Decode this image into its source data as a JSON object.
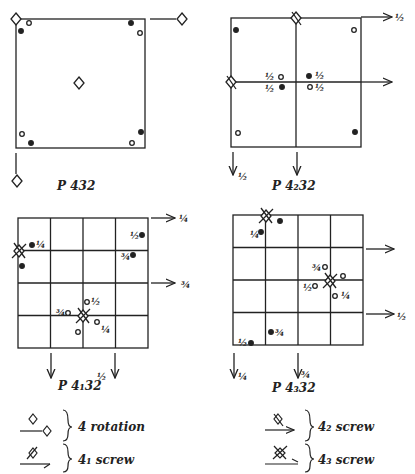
{
  "panels": [
    {
      "id": "p432",
      "title": "P 432"
    },
    {
      "id": "p4232",
      "title": "P 4₂32"
    },
    {
      "id": "p4132",
      "title": "P 4₁32"
    },
    {
      "id": "p4332",
      "title": "P 4₃32"
    }
  ],
  "fractions": {
    "half": "½",
    "quarter": "¼",
    "three_quarter": "¾"
  },
  "p4232_labels": {
    "top_right_arrow": "½",
    "bottom_left_arrow": "½",
    "mid_left_top": "½",
    "mid_left_bottom": "½",
    "mid_right_top": "½",
    "mid_right_bottom": "½"
  },
  "p4132_labels": {
    "top_right_arrow": "¼",
    "mid_right_arrow": "¾",
    "bottom_arrow": "½",
    "tl_point": "¼",
    "tr_top": "½",
    "tr_bottom": "¾",
    "center_left": "¾",
    "center_up": "½",
    "center_right": "¼"
  },
  "p4332_labels": {
    "right_arrow": "½",
    "bottom_left_arrow": "¼",
    "bottom_mid_arrow": "¾",
    "tl_point": "¼",
    "center_top": "¾",
    "center_left": "½",
    "center_right": "¼",
    "bl_point": "½",
    "bl2_point": "¾"
  },
  "legend": {
    "left": [
      {
        "label": "4 rotation",
        "icon": "4-fold-rotation-axis-icon"
      },
      {
        "label": "4₁ screw",
        "icon": "4-1-screw-axis-icon"
      }
    ],
    "right": [
      {
        "label": "4₂ screw",
        "icon": "4-2-screw-axis-icon"
      },
      {
        "label": "4₃ screw",
        "icon": "4-3-screw-axis-icon"
      }
    ]
  }
}
